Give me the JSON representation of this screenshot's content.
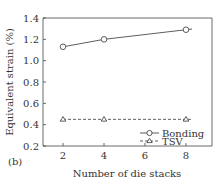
{
  "panel_label": "(b)",
  "chart_data": {
    "type": "line",
    "title": "",
    "xlabel": "Number of die stacks",
    "ylabel": "Equivalent strain (%)",
    "x": [
      2,
      4,
      8
    ],
    "xticks": [
      "2",
      "4",
      "6",
      "8"
    ],
    "yticks": [
      "0.2",
      "0.4",
      "0.6",
      "0.8",
      "1.0",
      "1.2",
      "1.4"
    ],
    "xlim": [
      1,
      9
    ],
    "ylim": [
      0.2,
      1.4
    ],
    "grid": false,
    "legend_position": "lower right",
    "series": [
      {
        "name": "Bonding",
        "values": [
          1.13,
          1.2,
          1.29
        ],
        "marker": "circle",
        "line": "solid"
      },
      {
        "name": "TSV",
        "values": [
          0.45,
          0.45,
          0.45
        ],
        "marker": "triangle",
        "line": "dashed"
      }
    ]
  }
}
